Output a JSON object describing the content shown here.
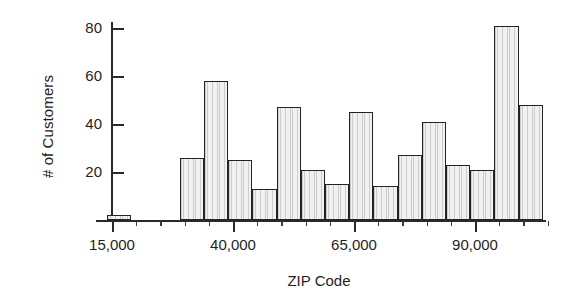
{
  "chart_data": {
    "type": "bar",
    "title": "",
    "subtitle": "",
    "xlabel": "ZIP Code",
    "ylabel": "# of Customers",
    "grid": false,
    "legend": null,
    "legend_position": "none",
    "xlim": [
      13000,
      113000
    ],
    "ylim": [
      0,
      88
    ],
    "y_ticks": [
      20,
      40,
      60,
      80
    ],
    "y_tick_labels": [
      "20",
      "40",
      "60",
      "80"
    ],
    "x_ticks": [
      15000,
      40000,
      65000,
      90000
    ],
    "x_tick_labels": [
      "15,000",
      "40,000",
      "65,000",
      "90,000"
    ],
    "x_minor_tick_step": 5000,
    "bin_width": 5000,
    "bar_fill_color": "#f1f1f1",
    "bar_edge_color": "#242424",
    "axis_color": "#2a2a2a",
    "text_color": "#1f1f1f",
    "background_color": "#ffffff",
    "note": "Histogram of number of customers by ZIP code bin; bars are 5,000-wide ZIP bins.",
    "bins": [
      {
        "bin_start": 14000,
        "bin_end": 19000,
        "label": "14,000-19,000",
        "value": 2
      },
      {
        "bin_start": 29000,
        "bin_end": 34000,
        "label": "29,000-34,000",
        "value": 26
      },
      {
        "bin_start": 34000,
        "bin_end": 39000,
        "label": "34,000-39,000",
        "value": 58
      },
      {
        "bin_start": 39000,
        "bin_end": 44000,
        "label": "39,000-44,000",
        "value": 25
      },
      {
        "bin_start": 44000,
        "bin_end": 49000,
        "label": "44,000-49,000",
        "value": 13
      },
      {
        "bin_start": 49000,
        "bin_end": 54000,
        "label": "49,000-54,000",
        "value": 47
      },
      {
        "bin_start": 54000,
        "bin_end": 59000,
        "label": "54,000-59,000",
        "value": 21
      },
      {
        "bin_start": 59000,
        "bin_end": 64000,
        "label": "59,000-64,000",
        "value": 15
      },
      {
        "bin_start": 64000,
        "bin_end": 69000,
        "label": "64,000-69,000",
        "value": 45
      },
      {
        "bin_start": 69000,
        "bin_end": 74000,
        "label": "69,000-74,000",
        "value": 14
      },
      {
        "bin_start": 74000,
        "bin_end": 79000,
        "label": "74,000-79,000",
        "value": 27
      },
      {
        "bin_start": 79000,
        "bin_end": 84000,
        "label": "79,000-84,000",
        "value": 41
      },
      {
        "bin_start": 84000,
        "bin_end": 89000,
        "label": "84,000-89,000",
        "value": 23
      },
      {
        "bin_start": 89000,
        "bin_end": 94000,
        "label": "89,000-94,000",
        "value": 21
      },
      {
        "bin_start": 94000,
        "bin_end": 99000,
        "label": "94,000-99,000",
        "value": 81
      },
      {
        "bin_start": 99000,
        "bin_end": 104000,
        "label": "99,000-104,000",
        "value": 48
      }
    ],
    "categories": [
      "14,000-19,000",
      "29,000-34,000",
      "34,000-39,000",
      "39,000-44,000",
      "44,000-49,000",
      "49,000-54,000",
      "54,000-59,000",
      "59,000-64,000",
      "64,000-69,000",
      "69,000-74,000",
      "74,000-79,000",
      "79,000-84,000",
      "84,000-89,000",
      "89,000-94,000",
      "94,000-99,000",
      "99,000-104,000"
    ],
    "values": [
      2,
      26,
      58,
      25,
      13,
      47,
      21,
      15,
      45,
      14,
      27,
      41,
      23,
      21,
      81,
      48
    ]
  }
}
